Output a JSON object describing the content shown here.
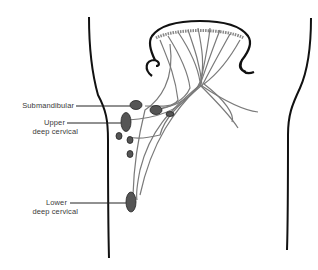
{
  "diagram": {
    "labels": {
      "submandibular": "Submandibular",
      "upper_line1": "Upper",
      "upper_line2": "deep cervical",
      "lower_line1": "Lower",
      "lower_line2": "deep cervical"
    },
    "colors": {
      "outline": "#111111",
      "vessel": "#7a7a7a",
      "node": "#555555",
      "background": "#ffffff"
    }
  }
}
